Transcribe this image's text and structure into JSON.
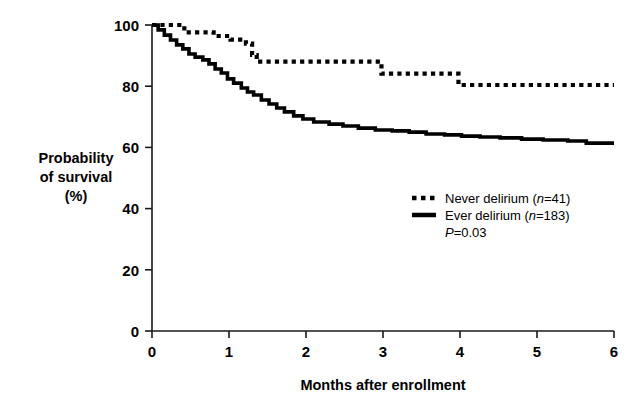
{
  "chart_data": {
    "type": "line",
    "title": "",
    "subtitle": "",
    "xlabel": "Months after enrollment",
    "ylabel": "Probability of survival (%)",
    "ylabel_lines": [
      "Probability",
      "of survival",
      "(%)"
    ],
    "xlim": [
      0,
      6
    ],
    "ylim": [
      0,
      100
    ],
    "xticks": [
      "0",
      "1",
      "2",
      "3",
      "4",
      "5",
      "6"
    ],
    "yticks": [
      "0",
      "20",
      "40",
      "60",
      "80",
      "100"
    ],
    "grid": false,
    "legend_position": "center-right",
    "annotations": [
      {
        "name": "p-value",
        "text": "P=0.03",
        "italic_prefix": "P",
        "rest": "=0.03"
      }
    ],
    "series": [
      {
        "name": "Never delirium",
        "label": "Never delirium (n=41)",
        "label_prefix": "Never delirium (",
        "label_italic": "n",
        "label_suffix": "=41)",
        "n": 41,
        "style": "dotted",
        "color": "#000000",
        "step_points": [
          [
            0.0,
            100.0
          ],
          [
            0.42,
            100.0
          ],
          [
            0.42,
            97.6
          ],
          [
            0.62,
            97.6
          ],
          [
            0.62,
            97.6
          ],
          [
            0.8,
            97.6
          ],
          [
            0.8,
            96.4
          ],
          [
            1.02,
            96.4
          ],
          [
            1.02,
            95.2
          ],
          [
            1.22,
            95.2
          ],
          [
            1.22,
            93.9
          ],
          [
            1.3,
            93.9
          ],
          [
            1.3,
            90.2
          ],
          [
            1.36,
            90.2
          ],
          [
            1.36,
            88.0
          ],
          [
            2.98,
            88.0
          ],
          [
            2.98,
            84.1
          ],
          [
            3.98,
            84.1
          ],
          [
            3.98,
            80.4
          ],
          [
            6.0,
            80.4
          ]
        ]
      },
      {
        "name": "Ever delirium",
        "label": "Ever delirium (n=183)",
        "label_prefix": "Ever delirium (",
        "label_italic": "n",
        "label_suffix": "=183)",
        "n": 183,
        "style": "solid",
        "color": "#000000",
        "step_points": [
          [
            0.0,
            100.0
          ],
          [
            0.08,
            100.0
          ],
          [
            0.08,
            98.4
          ],
          [
            0.16,
            98.4
          ],
          [
            0.16,
            96.7
          ],
          [
            0.24,
            96.7
          ],
          [
            0.24,
            95.1
          ],
          [
            0.32,
            95.1
          ],
          [
            0.32,
            93.5
          ],
          [
            0.4,
            93.5
          ],
          [
            0.4,
            92.2
          ],
          [
            0.48,
            92.2
          ],
          [
            0.48,
            90.5
          ],
          [
            0.56,
            90.5
          ],
          [
            0.56,
            89.5
          ],
          [
            0.66,
            89.5
          ],
          [
            0.66,
            88.6
          ],
          [
            0.74,
            88.6
          ],
          [
            0.74,
            87.3
          ],
          [
            0.82,
            87.3
          ],
          [
            0.82,
            85.6
          ],
          [
            0.9,
            85.6
          ],
          [
            0.9,
            84.3
          ],
          [
            0.98,
            84.3
          ],
          [
            0.98,
            82.4
          ],
          [
            1.06,
            82.4
          ],
          [
            1.06,
            81.0
          ],
          [
            1.16,
            81.0
          ],
          [
            1.16,
            79.4
          ],
          [
            1.24,
            79.4
          ],
          [
            1.24,
            78.1
          ],
          [
            1.32,
            78.1
          ],
          [
            1.32,
            77.1
          ],
          [
            1.42,
            77.1
          ],
          [
            1.42,
            75.5
          ],
          [
            1.52,
            75.5
          ],
          [
            1.52,
            74.2
          ],
          [
            1.62,
            74.2
          ],
          [
            1.62,
            72.9
          ],
          [
            1.72,
            72.9
          ],
          [
            1.72,
            71.6
          ],
          [
            1.84,
            71.6
          ],
          [
            1.84,
            70.3
          ],
          [
            1.96,
            70.3
          ],
          [
            1.96,
            69.3
          ],
          [
            2.1,
            69.3
          ],
          [
            2.1,
            68.3
          ],
          [
            2.3,
            68.3
          ],
          [
            2.3,
            67.6
          ],
          [
            2.48,
            67.6
          ],
          [
            2.48,
            67.0
          ],
          [
            2.68,
            67.0
          ],
          [
            2.68,
            66.3
          ],
          [
            2.9,
            66.3
          ],
          [
            2.9,
            65.7
          ],
          [
            3.12,
            65.7
          ],
          [
            3.12,
            65.4
          ],
          [
            3.34,
            65.4
          ],
          [
            3.34,
            65.0
          ],
          [
            3.56,
            65.0
          ],
          [
            3.56,
            64.4
          ],
          [
            3.8,
            64.4
          ],
          [
            3.8,
            64.1
          ],
          [
            4.02,
            64.1
          ],
          [
            4.02,
            63.7
          ],
          [
            4.26,
            63.7
          ],
          [
            4.26,
            63.4
          ],
          [
            4.52,
            63.4
          ],
          [
            4.52,
            63.1
          ],
          [
            4.8,
            63.1
          ],
          [
            4.8,
            62.7
          ],
          [
            5.08,
            62.7
          ],
          [
            5.08,
            62.4
          ],
          [
            5.4,
            62.4
          ],
          [
            5.4,
            62.1
          ],
          [
            5.64,
            62.1
          ],
          [
            5.64,
            61.4
          ],
          [
            6.0,
            61.4
          ]
        ]
      }
    ]
  },
  "axis": {
    "x_title": "Months after enrollment",
    "y_title_line1": "Probability",
    "y_title_line2": "of survival",
    "y_title_line3": "(%)",
    "xticks": [
      "0",
      "1",
      "2",
      "3",
      "4",
      "5",
      "6"
    ],
    "yticks": [
      "100",
      "80",
      "60",
      "40",
      "20",
      "0"
    ]
  },
  "legend": {
    "entries": [
      {
        "marker": "dotted-line-swatch",
        "text": "Never delirium (n=41)"
      },
      {
        "marker": "solid-line-swatch",
        "text": "Ever delirium (n=183)"
      }
    ],
    "pvalue": "P=0.03"
  }
}
